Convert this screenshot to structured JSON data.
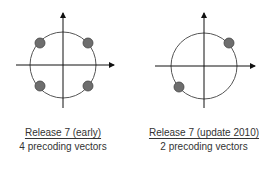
{
  "colors": {
    "axis": "#111111",
    "circle": "#555555",
    "dot_fill": "#6e6e6e",
    "dot_stroke": "#444444",
    "text": "#333333"
  },
  "diagrams": [
    {
      "title": "Release 7 (early)",
      "subtitle": "4 precoding vectors",
      "vector_count": 4,
      "vectors_angles_deg": [
        45,
        135,
        225,
        315
      ]
    },
    {
      "title": "Release 7 (update 2010)",
      "subtitle": "2 precoding vectors",
      "vector_count": 2,
      "vectors_angles_deg": [
        45,
        225
      ]
    }
  ]
}
